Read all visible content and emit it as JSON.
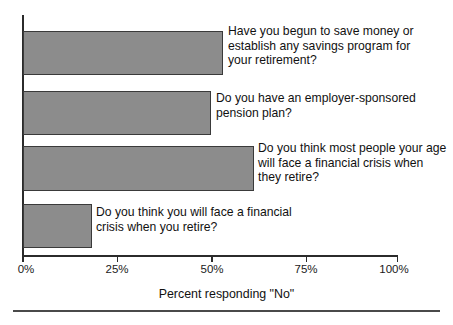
{
  "chart_data": {
    "type": "bar",
    "orientation": "horizontal",
    "title": "",
    "subtitle": "",
    "xlabel": "Percent responding \"No\"",
    "ylabel": "",
    "xlim": [
      0,
      100
    ],
    "grid": false,
    "legend": null,
    "bar_color": "#8c8c8c",
    "bar_edge_color": "#3a3a3a",
    "axis_color": "#2b2b2b",
    "tick_labels": [
      "0%",
      "25%",
      "50%",
      "75%",
      "100%"
    ],
    "tick_values": [
      0,
      25,
      50,
      75,
      100
    ],
    "categories": [
      "Have you begun to save money or establish any savings program for your retirement?",
      "Do you have an employer-sponsored pension plan?",
      "Do you think most people your age will face a financial crisis when they retire?",
      "Do you think you will face a financial crisis when you retire?"
    ],
    "values": [
      53.5,
      50.3,
      61.8,
      18.6
    ],
    "bars": [
      {
        "label": "Have you begun to save money or\nestablish any savings program for\nyour retirement?",
        "value": 53.5
      },
      {
        "label": "Do you have an employer-sponsored\npension plan?",
        "value": 50.3
      },
      {
        "label": "Do you think most people your age\nwill face a financial crisis when\nthey retire?",
        "value": 61.8
      },
      {
        "label": "Do you think you will face a financial\ncrisis when you retire?",
        "value": 18.6
      }
    ]
  }
}
